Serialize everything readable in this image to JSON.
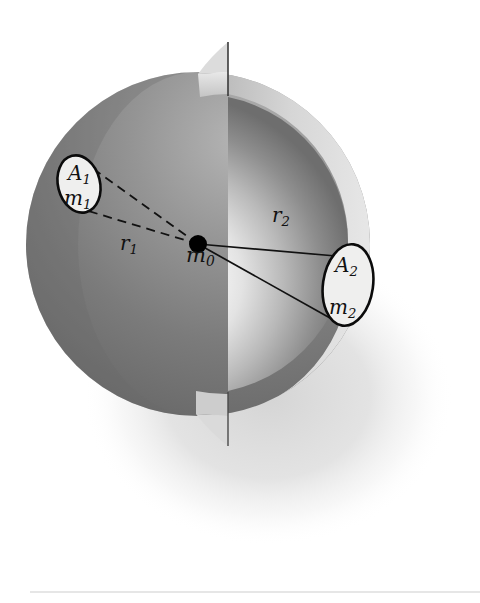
{
  "figure": {
    "background_color": "#ffffff",
    "labels": {
      "center_mass": {
        "base": "m",
        "sub": "0",
        "x": 186,
        "y": 262
      },
      "patch1_area": {
        "base": "A",
        "sub": "1",
        "x": 68,
        "y": 180
      },
      "patch1_mass": {
        "base": "m",
        "sub": "1",
        "x": 64,
        "y": 205
      },
      "patch2_area": {
        "base": "A",
        "sub": "2",
        "x": 335,
        "y": 272
      },
      "patch2_mass": {
        "base": "m",
        "sub": "2",
        "x": 329,
        "y": 314
      },
      "radius1": {
        "base": "r",
        "sub": "1",
        "x": 120,
        "y": 250
      },
      "radius2": {
        "base": "r",
        "sub": "2",
        "x": 272,
        "y": 222
      }
    },
    "geometry": {
      "sphere_center": {
        "x": 198,
        "y": 244
      },
      "sphere_outer_radius": 172,
      "sphere_inner_radius": 150,
      "center_dot_radius": 9,
      "cut_plane_x": 228,
      "patch1_ellipse": {
        "cx": 79,
        "cy": 184,
        "rx": 21,
        "ry": 29,
        "rotate": -14
      },
      "patch2_ellipse": {
        "cx": 348,
        "cy": 285,
        "rx": 25,
        "ry": 41,
        "rotate": 8
      },
      "shadow_ellipse": {
        "cx": 268,
        "cy": 396,
        "rx": 185,
        "ry": 150
      }
    },
    "colors": {
      "outer_shell_dark": "#6f6f6f",
      "outer_shell_light": "#9a9a9a",
      "inner_cavity": "#8f8f8f",
      "cavity_highlight": "#fdfdfd",
      "shell_rim": "#cfcfcf",
      "cut_face": "#d8d8d8",
      "shadow": "#e2e2e2",
      "stroke": "#111111",
      "patch_fill": "#efefee",
      "footer_rule": "#dedede"
    },
    "radius_lines": {
      "r1_style": "dashed",
      "r2_style": "solid"
    },
    "footer_rule": {
      "x1": 30,
      "x2": 480,
      "y": 592
    }
  }
}
